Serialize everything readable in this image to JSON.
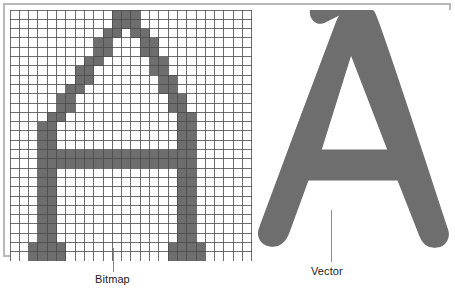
{
  "figure": {
    "background_color": "#ffffff",
    "frame_color": "#b9b9b9",
    "glyph": "A",
    "ink_color": "#6e6e6e",
    "grid_line_color": "#4a4a4a",
    "leader_color": "#8a8a8a",
    "label_color": "#1a1a1a"
  },
  "callouts": [
    {
      "id": "bitmap",
      "label": "Bitmap"
    },
    {
      "id": "vector",
      "label": "Vector"
    }
  ],
  "bitmap": {
    "label": "Bitmap",
    "cols": 26,
    "rows": 27,
    "cell_size": 9.3,
    "ink_color": "#6e6e6e",
    "paper_color": "#ffffff",
    "grid_line_color": "#4a4a4a",
    "grid_line_width": 0.8,
    "runs": [
      {
        "row": 0,
        "spans": [
          [
            11,
            14
          ]
        ]
      },
      {
        "row": 1,
        "spans": [
          [
            11,
            14
          ]
        ]
      },
      {
        "row": 2,
        "spans": [
          [
            10,
            12
          ],
          [
            13,
            15
          ]
        ]
      },
      {
        "row": 3,
        "spans": [
          [
            9,
            11
          ],
          [
            14,
            16
          ]
        ]
      },
      {
        "row": 4,
        "spans": [
          [
            9,
            11
          ],
          [
            14,
            16
          ]
        ]
      },
      {
        "row": 5,
        "spans": [
          [
            8,
            10
          ],
          [
            15,
            17
          ]
        ]
      },
      {
        "row": 6,
        "spans": [
          [
            7,
            9
          ],
          [
            15,
            17
          ]
        ]
      },
      {
        "row": 7,
        "spans": [
          [
            7,
            9
          ],
          [
            16,
            18
          ]
        ]
      },
      {
        "row": 8,
        "spans": [
          [
            6,
            8
          ],
          [
            16,
            18
          ]
        ]
      },
      {
        "row": 9,
        "spans": [
          [
            5,
            7
          ],
          [
            17,
            19
          ]
        ]
      },
      {
        "row": 10,
        "spans": [
          [
            5,
            7
          ],
          [
            17,
            19
          ]
        ]
      },
      {
        "row": 11,
        "spans": [
          [
            4,
            6
          ],
          [
            18,
            20
          ]
        ]
      },
      {
        "row": 12,
        "spans": [
          [
            3,
            5
          ],
          [
            18,
            20
          ]
        ]
      },
      {
        "row": 13,
        "spans": [
          [
            3,
            5
          ],
          [
            18,
            20
          ]
        ]
      },
      {
        "row": 14,
        "spans": [
          [
            3,
            5
          ],
          [
            18,
            20
          ]
        ]
      },
      {
        "row": 15,
        "spans": [
          [
            3,
            20
          ]
        ]
      },
      {
        "row": 16,
        "spans": [
          [
            3,
            20
          ]
        ]
      },
      {
        "row": 17,
        "spans": [
          [
            3,
            5
          ],
          [
            18,
            20
          ]
        ]
      },
      {
        "row": 18,
        "spans": [
          [
            3,
            5
          ],
          [
            18,
            20
          ]
        ]
      },
      {
        "row": 19,
        "spans": [
          [
            3,
            5
          ],
          [
            18,
            20
          ]
        ]
      },
      {
        "row": 20,
        "spans": [
          [
            3,
            5
          ],
          [
            18,
            20
          ]
        ]
      },
      {
        "row": 21,
        "spans": [
          [
            3,
            5
          ],
          [
            18,
            20
          ]
        ]
      },
      {
        "row": 22,
        "spans": [
          [
            3,
            5
          ],
          [
            18,
            20
          ]
        ]
      },
      {
        "row": 23,
        "spans": [
          [
            3,
            5
          ],
          [
            18,
            20
          ]
        ]
      },
      {
        "row": 24,
        "spans": [
          [
            3,
            5
          ],
          [
            18,
            20
          ]
        ]
      },
      {
        "row": 25,
        "spans": [
          [
            2,
            6
          ],
          [
            17,
            21
          ]
        ]
      },
      {
        "row": 26,
        "spans": [
          [
            2,
            6
          ],
          [
            17,
            21
          ]
        ]
      }
    ]
  },
  "vector": {
    "label": "Vector",
    "ink_color": "#6e6e6e",
    "path": "M 108 6 C 108 6 120 2 127 10 C 132 16 196 215 200 226 C 204 236 198 244 190 245 C 182 246 176 242 173 234 L 151 178 L 61 178 L 42 230 C 38 241 31 245 23 244 C 14 243 9 234 13 225 C 17 214 86 28 90 19 C 92 14 94 12 96 11 L 78 20 C 72 23 66 20 64 14 C 62 8 65 3 71 1 Z M 104 52 L 74 148 L 141 148 Z"
  }
}
